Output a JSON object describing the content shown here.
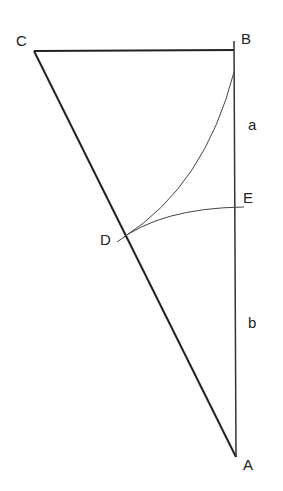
{
  "diagram": {
    "type": "geometry",
    "points": {
      "A": {
        "label": "A",
        "x": 236,
        "y": 457
      },
      "B": {
        "label": "B",
        "x": 234,
        "y": 50
      },
      "C": {
        "label": "C",
        "x": 34,
        "y": 51
      },
      "D": {
        "label": "D",
        "x": 121,
        "y": 238
      },
      "E": {
        "label": "E",
        "x": 235,
        "y": 208
      }
    },
    "segment_labels": {
      "a": "a",
      "b": "b"
    },
    "colors": {
      "line": "#222222",
      "background": "#ffffff"
    }
  }
}
